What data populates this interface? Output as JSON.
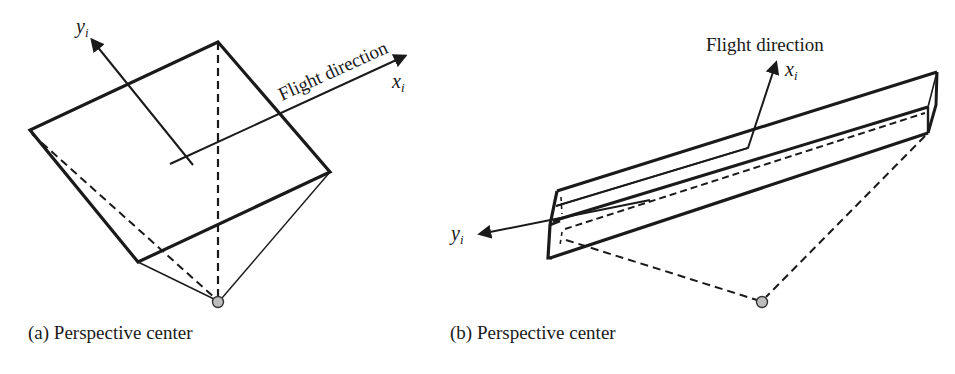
{
  "figure": {
    "panels": [
      {
        "id": "a",
        "caption": "(a) Perspective center",
        "flight_label": "Flight direction",
        "x_axis": {
          "symbol": "x",
          "subscript": "i"
        },
        "y_axis": {
          "symbol": "y",
          "subscript": "i"
        },
        "description": "Square image frame viewed in perspective with dashed and solid projection lines meeting at the perspective center"
      },
      {
        "id": "b",
        "caption": "(b) Perspective center",
        "flight_label": "Flight direction",
        "x_axis": {
          "symbol": "x",
          "subscript": "i"
        },
        "y_axis": {
          "symbol": "y",
          "subscript": "i"
        },
        "description": "Long narrow prism (linear array strip) with dashed projection lines to the perspective center"
      }
    ],
    "colors": {
      "line": "#1a1a1a",
      "perspective_center_fill": "#bdbdbd",
      "background": "#ffffff"
    }
  }
}
